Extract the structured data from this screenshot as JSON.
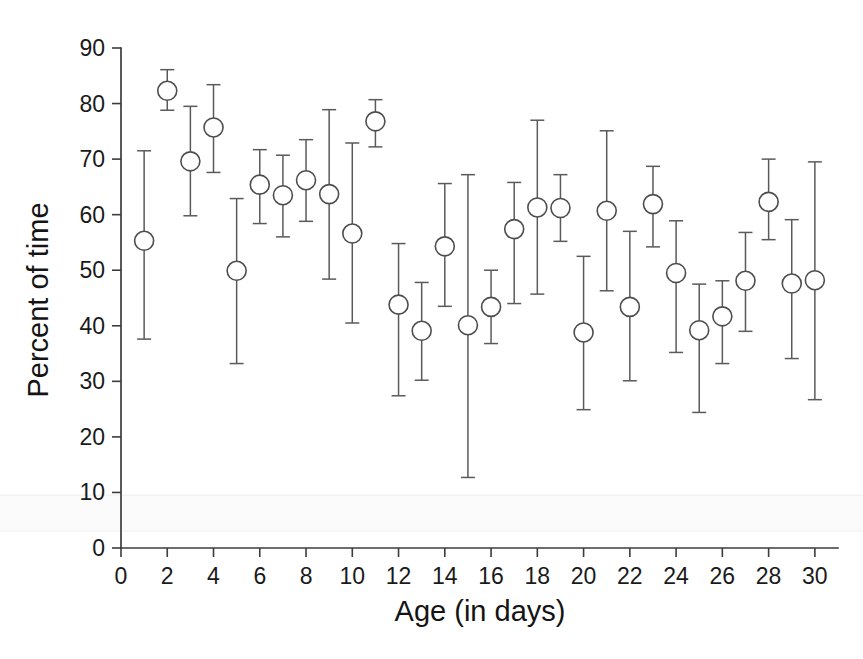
{
  "chart_data": {
    "type": "scatter",
    "title": "",
    "subtitle": "",
    "xlabel": "Age (in days)",
    "ylabel": "Percent of time",
    "xlim": [
      0,
      31
    ],
    "ylim": [
      0,
      90
    ],
    "xticks": [
      0,
      2,
      4,
      6,
      8,
      10,
      12,
      14,
      16,
      18,
      20,
      22,
      24,
      26,
      28,
      30
    ],
    "yticks": [
      0,
      10,
      20,
      30,
      40,
      50,
      60,
      70,
      80,
      90
    ],
    "xticklabels": [
      "0",
      "2",
      "4",
      "6",
      "8",
      "10",
      "12",
      "14",
      "16",
      "18",
      "20",
      "22",
      "24",
      "26",
      "28",
      "30"
    ],
    "yticklabels": [
      "0",
      "10",
      "20",
      "30",
      "40",
      "50",
      "60",
      "70",
      "80",
      "90"
    ],
    "grid": false,
    "legend": null,
    "legend_position": "none",
    "marker_style": "open-circle",
    "error_style": "capped-vertical",
    "x": [
      1,
      2,
      3,
      4,
      5,
      6,
      7,
      8,
      9,
      10,
      11,
      12,
      13,
      14,
      15,
      16,
      17,
      18,
      19,
      20,
      21,
      22,
      23,
      24,
      25,
      26,
      27,
      28,
      29,
      30
    ],
    "values": [
      55.3,
      82.3,
      69.6,
      75.7,
      49.9,
      65.4,
      63.5,
      66.2,
      63.7,
      56.6,
      76.8,
      43.8,
      39.1,
      54.3,
      40.1,
      43.4,
      57.4,
      61.3,
      61.2,
      38.8,
      60.7,
      43.4,
      61.9,
      49.5,
      39.2,
      41.7,
      48.1,
      62.3,
      47.6,
      48.2
    ],
    "err_upper": [
      71.5,
      86.1,
      79.5,
      83.4,
      62.9,
      71.7,
      70.7,
      73.5,
      78.9,
      72.9,
      80.7,
      54.8,
      47.8,
      65.6,
      67.2,
      50.0,
      65.8,
      77.0,
      67.2,
      52.5,
      75.1,
      57.0,
      68.7,
      58.9,
      47.5,
      48.1,
      56.8,
      70.0,
      59.1,
      69.5
    ],
    "err_lower": [
      37.6,
      78.8,
      59.8,
      67.6,
      33.2,
      58.4,
      56.0,
      58.8,
      48.4,
      40.5,
      72.2,
      27.4,
      30.2,
      43.5,
      12.7,
      36.8,
      44.0,
      45.7,
      55.2,
      24.9,
      46.3,
      30.1,
      54.2,
      35.2,
      24.4,
      33.2,
      39.0,
      55.5,
      34.1,
      26.7
    ],
    "series_name": "Percent of time"
  },
  "colors": {
    "background": "#ffffff",
    "axis": "#3c3c3c",
    "marker_stroke": "#4d4d4d",
    "marker_fill": "#ffffff",
    "errorbar": "#5a5a5a",
    "text": "#1a1a1a"
  }
}
